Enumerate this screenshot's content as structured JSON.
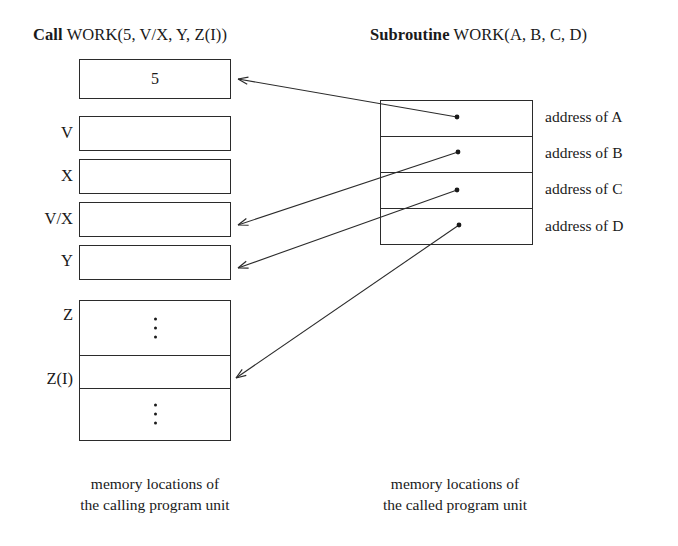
{
  "headings": {
    "left": {
      "keyword": "Call",
      "rest": " WORK(5, V/X, Y, Z(I))"
    },
    "right": {
      "keyword": "Subroutine",
      "rest": " WORK(A, B, C, D)"
    }
  },
  "left_column": {
    "labels": [
      "",
      "V",
      "X",
      "V/X",
      "Y",
      "Z",
      "Z(I)",
      ""
    ],
    "cells": [
      {
        "label": "",
        "value": "5",
        "dots": false
      },
      {
        "label": "V",
        "value": "",
        "dots": false
      },
      {
        "label": "X",
        "value": "",
        "dots": false
      },
      {
        "label": "V/X",
        "value": "",
        "dots": false
      },
      {
        "label": "Y",
        "value": "",
        "dots": false
      },
      {
        "label": "Z",
        "value": "",
        "dots": true
      },
      {
        "label": "Z(I)",
        "value": "",
        "dots": false
      },
      {
        "label": "",
        "value": "",
        "dots": true
      }
    ],
    "caption_line1": "memory locations of",
    "caption_line2": "the calling program unit"
  },
  "right_column": {
    "cells": [
      {
        "label": "address of A"
      },
      {
        "label": "address of B"
      },
      {
        "label": "address of C"
      },
      {
        "label": "address of D"
      }
    ],
    "caption_line1": "memory locations of",
    "caption_line2": "the called program unit"
  },
  "connectors": [
    {
      "from": "address of A",
      "to": "5"
    },
    {
      "from": "address of B",
      "to": "V/X"
    },
    {
      "from": "address of C",
      "to": "Y"
    },
    {
      "from": "address of D",
      "to": "Z(I)"
    }
  ],
  "colors": {
    "ink": "#1a1a1a",
    "stroke": "#2b2b2b",
    "background": "#ffffff"
  }
}
